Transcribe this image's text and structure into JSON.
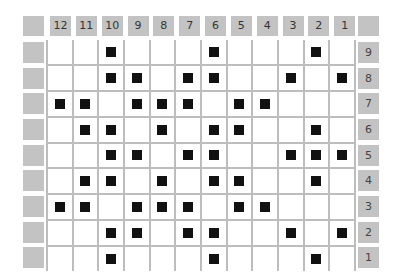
{
  "columns": [
    "12",
    "11",
    "10",
    "9",
    "8",
    "7",
    "6",
    "5",
    "4",
    "3",
    "2",
    "1"
  ],
  "rows": [
    {
      "label": "9",
      "filled": [
        10,
        6,
        2
      ]
    },
    {
      "label": "8",
      "filled": [
        10,
        9,
        7,
        6,
        3,
        1
      ]
    },
    {
      "label": "7",
      "filled": [
        12,
        11,
        9,
        8,
        7,
        5,
        4
      ]
    },
    {
      "label": "6",
      "filled": [
        11,
        10,
        8,
        6,
        5,
        2
      ]
    },
    {
      "label": "5",
      "filled": [
        10,
        9,
        7,
        6,
        3,
        2,
        1
      ]
    },
    {
      "label": "4",
      "filled": [
        11,
        10,
        8,
        6,
        5,
        2
      ]
    },
    {
      "label": "3",
      "filled": [
        12,
        11,
        9,
        8,
        7,
        5,
        4
      ]
    },
    {
      "label": "2",
      "filled": [
        10,
        9,
        7,
        6,
        3,
        1
      ]
    },
    {
      "label": "1",
      "filled": [
        10,
        6,
        2
      ]
    }
  ],
  "colors": {
    "header": "#c3c3c3",
    "gridline": "#bdbdbd",
    "filled": "#111111",
    "cell": "#ffffff"
  }
}
